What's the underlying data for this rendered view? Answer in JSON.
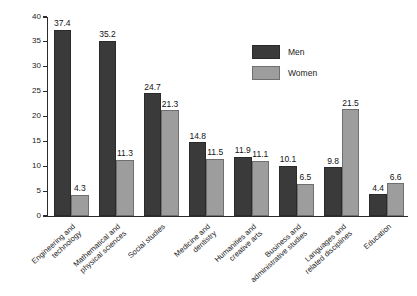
{
  "chart_data": {
    "type": "bar",
    "title": "",
    "xlabel": "",
    "ylabel": "Number of courses taken (thousands)",
    "ylim": [
      0,
      40
    ],
    "yticks": [
      0,
      5,
      10,
      15,
      20,
      25,
      30,
      35,
      40
    ],
    "ytick_labels": [
      "0",
      "5",
      "10",
      "15",
      "20",
      "25",
      "30",
      "35",
      "40"
    ],
    "grid": false,
    "legend_position": "inside-top-right",
    "categories": [
      "Engineering and technology",
      "Mathematical and physical sciences",
      "Social studies",
      "Medicine and dentistry",
      "Humanities and creative arts",
      "Business and administrative studies",
      "Languages and related disciplines",
      "Education"
    ],
    "category_lines": [
      [
        "Engineering and",
        "technology"
      ],
      [
        "Mathematical and",
        "physical sciences"
      ],
      [
        "Social studies",
        ""
      ],
      [
        "Medicine and",
        "dentistry"
      ],
      [
        "Humanities and",
        "creative arts"
      ],
      [
        "Business and",
        "administrative studies"
      ],
      [
        "Languages and",
        "related disciplines"
      ],
      [
        "Education",
        ""
      ]
    ],
    "series": [
      {
        "name": "Men",
        "color": "#3a3a3a",
        "values": [
          37.4,
          35.2,
          24.7,
          14.8,
          11.9,
          10.1,
          9.8,
          4.4
        ],
        "value_labels": [
          "37.4",
          "35.2",
          "24.7",
          "14.8",
          "11.9",
          "10.1",
          "9.8",
          "4.4"
        ]
      },
      {
        "name": "Women",
        "color": "#9d9d9d",
        "values": [
          4.3,
          11.3,
          21.3,
          11.5,
          11.1,
          6.5,
          21.5,
          6.6
        ],
        "value_labels": [
          "4.3",
          "11.3",
          "21.3",
          "11.5",
          "11.1",
          "6.5",
          "21.5",
          "6.6"
        ]
      }
    ]
  }
}
